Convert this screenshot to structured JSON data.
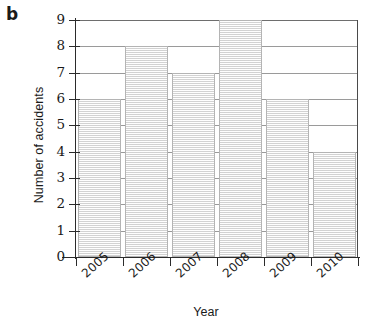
{
  "figure": {
    "panel_letter": "b"
  },
  "chart_data": {
    "type": "bar",
    "title": "",
    "xlabel": "Year",
    "ylabel": "Number of accidents",
    "categories": [
      "2005",
      "2006",
      "2007",
      "2008",
      "2009",
      "2010"
    ],
    "values": [
      6,
      8,
      7,
      9,
      6,
      4
    ],
    "ylim": [
      0,
      9
    ],
    "yticks": [
      0,
      1,
      2,
      3,
      4,
      5,
      6,
      7,
      8,
      9
    ],
    "ytick_labels": [
      "0",
      "1",
      "2",
      "3",
      "4",
      "5",
      "6",
      "7",
      "8",
      "9"
    ],
    "grid": "horizontal",
    "legend": "none",
    "bar_fill_color": "#eeeeee",
    "bar_edge_color": "#b4b4b4",
    "gridline_color": "#9a9a9a",
    "axis_color": "#2b2b2b",
    "xtick_label_rotation": -42
  }
}
